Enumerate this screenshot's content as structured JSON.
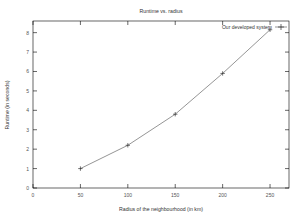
{
  "chart_data": {
    "type": "line",
    "title": "Runtime vs. radius",
    "xlabel": "Radius of the neighbourhood (in km)",
    "ylabel": "Runtime (in seconds)",
    "xlim": [
      0,
      270
    ],
    "ylim": [
      0,
      8.6
    ],
    "xticks": [
      0,
      50,
      100,
      150,
      200,
      250
    ],
    "xtick_labels": [
      "0",
      "50",
      "100",
      "150",
      "200",
      "250"
    ],
    "yticks": [
      0,
      1,
      2,
      3,
      4,
      5,
      6,
      7,
      8
    ],
    "ytick_labels": [
      "0",
      "1",
      "2",
      "3",
      "4",
      "5",
      "6",
      "7",
      "8"
    ],
    "grid": false,
    "legend_position": "top-right",
    "series": [
      {
        "name": "Our developed system",
        "color": "#4d4d4d",
        "marker": "plus",
        "x": [
          50,
          100,
          150,
          200,
          250
        ],
        "values": [
          1.0,
          2.2,
          3.8,
          5.9,
          8.15
        ]
      }
    ]
  }
}
